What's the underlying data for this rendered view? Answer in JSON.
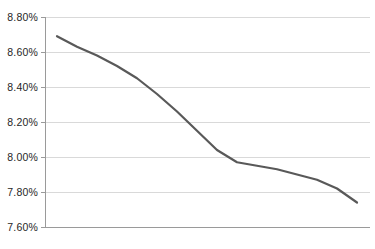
{
  "chart_data": {
    "type": "line",
    "title": "",
    "subtitle": "",
    "xlabel": "",
    "ylabel": "",
    "ylim": [
      7.6,
      8.8
    ],
    "ytick_labels": [
      "8.80%",
      "8.60%",
      "8.40%",
      "8.20%",
      "8.00%",
      "7.80%",
      "7.60%"
    ],
    "ytick_values": [
      8.8,
      8.6,
      8.4,
      8.2,
      8.0,
      7.8,
      7.6
    ],
    "xtick_labels": [],
    "grid": "horizontal",
    "legend": "none",
    "series": [
      {
        "name": "",
        "color": "#595959",
        "x": [
          0,
          1,
          2,
          3,
          4,
          5,
          6,
          7,
          8,
          9,
          10,
          11,
          12,
          13,
          14,
          15
        ],
        "values": [
          8.69,
          8.63,
          8.58,
          8.52,
          8.45,
          8.36,
          8.26,
          8.15,
          8.04,
          7.97,
          7.95,
          7.93,
          7.9,
          7.87,
          7.82,
          7.74
        ]
      }
    ],
    "annotations": []
  },
  "axis": {
    "y_labels": [
      "8.80%",
      "8.60%",
      "8.40%",
      "8.20%",
      "8.00%",
      "7.80%",
      "7.60%"
    ]
  },
  "colors": {
    "series_line": "#595959",
    "gridline": "#d9d9d9",
    "axis": "#9a9a9a",
    "tick_text": "#262626",
    "background": "#ffffff"
  }
}
